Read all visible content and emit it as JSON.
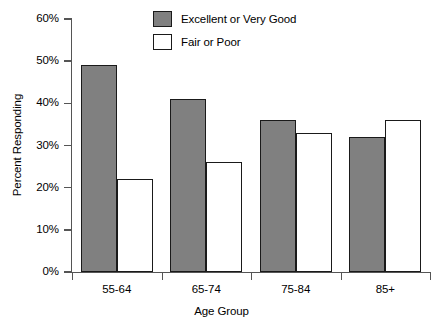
{
  "chart_data": {
    "type": "bar",
    "title": "",
    "xlabel": "Age Group",
    "ylabel": "Percent Responding",
    "categories": [
      "55-64",
      "65-74",
      "75-84",
      "85+"
    ],
    "series": [
      {
        "name": "Excellent or Very Good",
        "values": [
          49,
          41,
          36,
          32
        ],
        "color": "#808080"
      },
      {
        "name": "Fair or Poor",
        "values": [
          22,
          26,
          33,
          36
        ],
        "color": "#ffffff"
      }
    ],
    "ylim": [
      0,
      60
    ],
    "ytick_values": [
      0,
      10,
      20,
      30,
      40,
      50,
      60
    ],
    "ytick_labels": [
      "0%",
      "10%",
      "20%",
      "30%",
      "40%",
      "50%",
      "60%"
    ],
    "grid": false,
    "legend_position": "top-center",
    "value_suffix": "%"
  },
  "legend": {
    "items": [
      {
        "label": "Excellent or Very Good",
        "swatch": "filled-gray-swatch"
      },
      {
        "label": "Fair or Poor",
        "swatch": "outlined-white-swatch"
      }
    ]
  },
  "axes": {
    "y_title": "Percent Responding",
    "x_title": "Age Group"
  }
}
